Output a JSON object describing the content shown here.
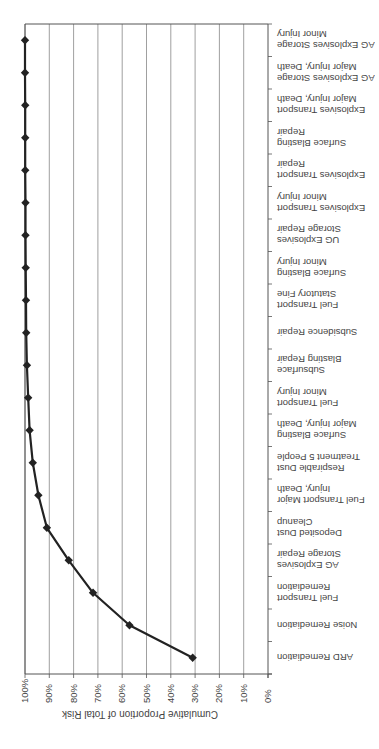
{
  "chart_data": {
    "type": "line",
    "title": "",
    "orientation": "rotated 180 degrees; horizontal cumulative (Pareto) line chart",
    "xlabel": "Cumulative Proportion of Total Risk",
    "ylabel": "",
    "xlim": [
      0,
      100
    ],
    "x_ticks": [
      "0%",
      "10%",
      "20%",
      "30%",
      "40%",
      "50%",
      "60%",
      "70%",
      "80%",
      "90%",
      "100%"
    ],
    "grid": true,
    "legend": null,
    "marker": "diamond",
    "categories": [
      "ARD Remediation",
      "Noise Remediation",
      "Fuel Transport\nRemediation",
      "AG Explosives\nStorage Repair",
      "Deposited Dust\nCleanup",
      "Fuel Transport Major\nInjury, Death",
      "Respirable Dust\nTreatment 5 People",
      "Surface Blasting\nMajor Injury, Death",
      "Fuel Transport\nMinor Injury",
      "Subsurface\nBlasting Repair",
      "Subsidence Repair",
      "Fuel Transport\nStatutory Fine",
      "Surface Blasting\nMinor Injury",
      "UG Explosives\nStorage Repair",
      "Explosives Transport\nMinor Injury",
      "Explosives Transport\nRepair",
      "Surface Blasting\nRepair",
      "Explosives Transport\nMajor Injury, Death",
      "AG Explosives Storage\nMajor Injury, Death",
      "AG Explosives Storage\nMinor Injury"
    ],
    "series": [
      {
        "name": "Cumulative Proportion of Total Risk",
        "values": [
          31,
          57,
          72,
          82,
          91,
          94.5,
          96.8,
          98.1,
          98.7,
          99.2,
          99.5,
          99.6,
          99.7,
          99.8,
          99.8,
          99.9,
          99.9,
          99.9,
          100,
          100
        ]
      }
    ],
    "colors": {
      "line": "#222222",
      "grid": "#888888",
      "axis": "#555555"
    }
  }
}
